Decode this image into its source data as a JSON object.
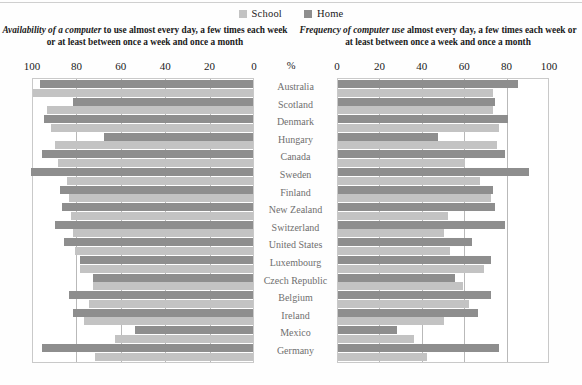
{
  "legend": {
    "items": [
      {
        "label": "School",
        "color": "#c3c3c3",
        "key": "school"
      },
      {
        "label": "Home",
        "color": "#8e8e8e",
        "key": "home"
      }
    ]
  },
  "panels": [
    {
      "id": "left",
      "title_italic": "Availability of a computer",
      "title_rest": " to use almost every day, a few times each week or at least between once a week and once a month",
      "direction": "rtl",
      "ticks": [
        "100",
        "80",
        "60",
        "40",
        "20",
        "0"
      ]
    },
    {
      "id": "right",
      "title_italic": "Frequency of computer use",
      "title_rest": " almost every day, a few times each week or at least between once a week and once a month",
      "direction": "ltr",
      "ticks": [
        "0",
        "20",
        "40",
        "60",
        "80",
        "100"
      ]
    }
  ],
  "axis": {
    "unit_label": "%",
    "min": 0,
    "max": 100,
    "tick_step": 20
  },
  "chart_data": {
    "type": "bar",
    "orientation": "horizontal",
    "layout": "back-to-back paired panels",
    "xlabel": "%",
    "ylabel": "",
    "xlim": [
      0,
      100
    ],
    "grid": true,
    "legend_position": "top-center",
    "categories": [
      "Australia",
      "Scotland",
      "Denmark",
      "Hungary",
      "Canada",
      "Sweden",
      "Finland",
      "New Zealand",
      "Switzerland",
      "United States",
      "Luxembourg",
      "Czech Republic",
      "Belgium",
      "Ireland",
      "Mexico",
      "Germany"
    ],
    "panels": [
      {
        "name": "Availability of a computer",
        "series": [
          {
            "name": "Home",
            "values": [
              96,
              81,
              94,
              67,
              95,
              100,
              87,
              86,
              89,
              85,
              78,
              83,
              72,
              86,
              81,
              53,
              95
            ]
          },
          {
            "name": "School",
            "values": [
              99,
              93,
              91,
              89,
              88,
              84,
              83,
              82,
              81,
              80,
              78,
              72,
              74,
              76,
              62,
              71,
              87
            ]
          }
        ]
      },
      {
        "name": "Frequency of computer use",
        "series": [
          {
            "name": "Home",
            "values": [
              85,
              74,
              80,
              47,
              79,
              90,
              73,
              74,
              79,
              63,
              72,
              55,
              72,
              66,
              28,
              76
            ]
          },
          {
            "name": "School",
            "values": [
              73,
              73,
              76,
              75,
              60,
              67,
              72,
              52,
              50,
              53,
              69,
              59,
              62,
              50,
              36,
              42
            ]
          }
        ]
      }
    ],
    "rows": [
      {
        "country": "Australia",
        "left_home": 96,
        "left_school": 99,
        "right_home": 85,
        "right_school": 73
      },
      {
        "country": "Scotland",
        "left_home": 81,
        "left_school": 93,
        "right_home": 74,
        "right_school": 73
      },
      {
        "country": "Denmark",
        "left_home": 94,
        "left_school": 91,
        "right_home": 80,
        "right_school": 76
      },
      {
        "country": "Hungary",
        "left_home": 67,
        "left_school": 89,
        "right_home": 47,
        "right_school": 75
      },
      {
        "country": "Canada",
        "left_home": 95,
        "left_school": 88,
        "right_home": 79,
        "right_school": 60
      },
      {
        "country": "Sweden",
        "left_home": 100,
        "left_school": 84,
        "right_home": 90,
        "right_school": 67
      },
      {
        "country": "Finland",
        "left_home": 87,
        "left_school": 83,
        "right_home": 73,
        "right_school": 72
      },
      {
        "country": "New Zealand",
        "left_home": 86,
        "left_school": 82,
        "right_home": 74,
        "right_school": 52
      },
      {
        "country": "Switzerland",
        "left_home": 89,
        "left_school": 81,
        "right_home": 79,
        "right_school": 50
      },
      {
        "country": "United States",
        "left_home": 85,
        "left_school": 80,
        "right_home": 63,
        "right_school": 53
      },
      {
        "country": "Luxembourg",
        "left_home": 78,
        "left_school": 78,
        "right_home": 72,
        "right_school": 69
      },
      {
        "country": "Czech Republic",
        "left_home": 72,
        "left_school": 72,
        "right_home": 55,
        "right_school": 59
      },
      {
        "country": "Belgium",
        "left_home": 83,
        "left_school": 74,
        "right_home": 72,
        "right_school": 62
      },
      {
        "country": "Ireland",
        "left_home": 81,
        "left_school": 76,
        "right_home": 66,
        "right_school": 50
      },
      {
        "country": "Mexico",
        "left_home": 53,
        "left_school": 62,
        "right_home": 28,
        "right_school": 36
      },
      {
        "country": "Germany",
        "left_home": 95,
        "left_school": 71,
        "right_home": 76,
        "right_school": 42
      }
    ]
  }
}
